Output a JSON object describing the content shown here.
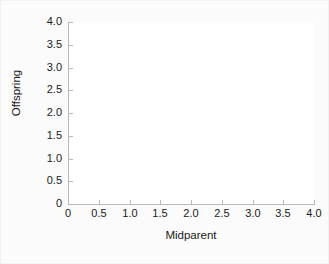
{
  "chart_data": {
    "type": "scatter",
    "title": "",
    "xlabel": "Midparent",
    "ylabel": "Offspring",
    "xlim": [
      0,
      4.0
    ],
    "ylim": [
      0,
      4.0
    ],
    "xticks": [
      "0",
      "0.5",
      "1.0",
      "1.5",
      "2.0",
      "2.5",
      "3.0",
      "3.5",
      "4.0"
    ],
    "xtick_values": [
      0,
      0.5,
      1.0,
      1.5,
      2.0,
      2.5,
      3.0,
      3.5,
      4.0
    ],
    "yticks": [
      "0",
      "0.5",
      "1.0",
      "1.5",
      "2.0",
      "2.5",
      "3.0",
      "3.5",
      "4.0"
    ],
    "ytick_values": [
      0,
      0.5,
      1.0,
      1.5,
      2.0,
      2.5,
      3.0,
      3.5,
      4.0
    ],
    "series": [],
    "values": [],
    "grid": false,
    "legend": false,
    "annotations": [],
    "plot_background": "#ffffff",
    "figure_background": "#fbfbfb",
    "axis_color": "#b8b8b8",
    "text_color": "#1a1a1a"
  }
}
